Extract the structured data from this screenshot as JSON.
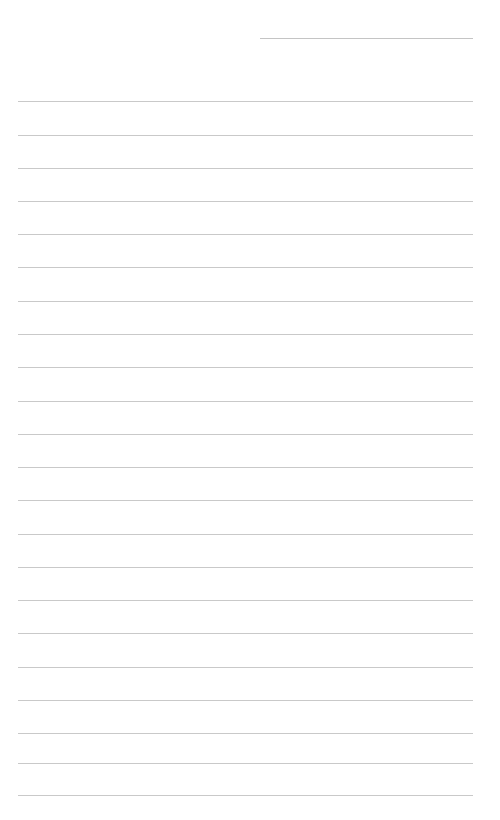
{
  "document": {
    "type": "lined-paper",
    "title": "",
    "background_color": "#ffffff",
    "page_width": 500,
    "page_height": 820,
    "written_text": "",
    "is_blank": "true"
  },
  "ruling": {
    "line_color": "#c9c9c9",
    "short_line_color": "#c4c4c4",
    "line_thickness_px": 1,
    "line_spacing_px": 33.5,
    "full_line_left_px": 18,
    "full_line_right_px": 473,
    "short_line_left_px": 260,
    "short_line_right_px": 473,
    "short_line_count": 1,
    "full_line_count": 21,
    "lines": [
      {
        "id": "rule-0",
        "kind": "short",
        "y": 38,
        "x": 260,
        "width": 213,
        "color": "#c4c4c4"
      },
      {
        "id": "rule-1",
        "kind": "full",
        "y": 101,
        "x": 18,
        "width": 455,
        "color": "#c9c9c9"
      },
      {
        "id": "rule-2",
        "kind": "full",
        "y": 135,
        "x": 18,
        "width": 455,
        "color": "#c9c9c9"
      },
      {
        "id": "rule-3",
        "kind": "full",
        "y": 168,
        "x": 18,
        "width": 455,
        "color": "#c9c9c9"
      },
      {
        "id": "rule-4",
        "kind": "full",
        "y": 201,
        "x": 18,
        "width": 455,
        "color": "#c9c9c9"
      },
      {
        "id": "rule-5",
        "kind": "full",
        "y": 234,
        "x": 18,
        "width": 455,
        "color": "#c9c9c9"
      },
      {
        "id": "rule-6",
        "kind": "full",
        "y": 267,
        "x": 18,
        "width": 455,
        "color": "#c9c9c9"
      },
      {
        "id": "rule-7",
        "kind": "full",
        "y": 301,
        "x": 18,
        "width": 455,
        "color": "#c9c9c9"
      },
      {
        "id": "rule-8",
        "kind": "full",
        "y": 334,
        "x": 18,
        "width": 455,
        "color": "#c9c9c9"
      },
      {
        "id": "rule-9",
        "kind": "full",
        "y": 367,
        "x": 18,
        "width": 455,
        "color": "#c9c9c9"
      },
      {
        "id": "rule-10",
        "kind": "full",
        "y": 401,
        "x": 18,
        "width": 455,
        "color": "#c9c9c9"
      },
      {
        "id": "rule-11",
        "kind": "full",
        "y": 434,
        "x": 18,
        "width": 455,
        "color": "#c9c9c9"
      },
      {
        "id": "rule-12",
        "kind": "full",
        "y": 467,
        "x": 18,
        "width": 455,
        "color": "#c9c9c9"
      },
      {
        "id": "rule-13",
        "kind": "full",
        "y": 500,
        "x": 18,
        "width": 455,
        "color": "#c9c9c9"
      },
      {
        "id": "rule-14",
        "kind": "full",
        "y": 534,
        "x": 18,
        "width": 455,
        "color": "#c9c9c9"
      },
      {
        "id": "rule-15",
        "kind": "full",
        "y": 567,
        "x": 18,
        "width": 455,
        "color": "#c9c9c9"
      },
      {
        "id": "rule-16",
        "kind": "full",
        "y": 600,
        "x": 18,
        "width": 455,
        "color": "#c9c9c9"
      },
      {
        "id": "rule-17",
        "kind": "full",
        "y": 633,
        "x": 18,
        "width": 455,
        "color": "#c9c9c9"
      },
      {
        "id": "rule-18",
        "kind": "full",
        "y": 667,
        "x": 18,
        "width": 455,
        "color": "#c9c9c9"
      },
      {
        "id": "rule-19",
        "kind": "full",
        "y": 700,
        "x": 18,
        "width": 455,
        "color": "#c9c9c9"
      },
      {
        "id": "rule-20",
        "kind": "full",
        "y": 733,
        "x": 18,
        "width": 455,
        "color": "#c9c9c9"
      },
      {
        "id": "rule-21",
        "kind": "full",
        "y": 763,
        "x": 18,
        "width": 455,
        "color": "#c9c9c9"
      },
      {
        "id": "rule-22",
        "kind": "full",
        "y": 795,
        "x": 18,
        "width": 455,
        "color": "#c9c9c9"
      }
    ]
  }
}
